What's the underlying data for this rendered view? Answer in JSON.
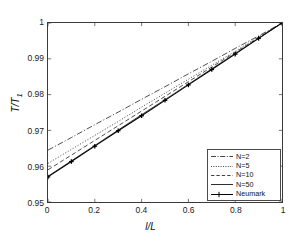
{
  "chart_data": {
    "type": "line",
    "title": "",
    "xlabel": "l/L",
    "ylabel": "T/T1",
    "ylabel_base": "T/T",
    "ylabel_sub": "1",
    "xlim": [
      0,
      1
    ],
    "ylim": [
      0.95,
      1
    ],
    "grid": false,
    "legend_position": "lower right",
    "xticks": [
      0,
      0.2,
      0.4,
      0.6,
      0.8,
      1
    ],
    "xtick_labels": [
      "0",
      "0.2",
      "0.4",
      "0.6",
      "0.8",
      "1"
    ],
    "yticks": [
      0.95,
      0.96,
      0.97,
      0.98,
      0.99,
      1
    ],
    "ytick_labels": [
      "0.95",
      "0.96",
      "0.97",
      "0.98",
      "0.99",
      "1"
    ],
    "x": [
      0,
      0.1,
      0.2,
      0.3,
      0.4,
      0.5,
      0.6,
      0.7,
      0.8,
      0.9,
      1
    ],
    "series": [
      {
        "name": "N=2",
        "style": "dashdot",
        "color": "#2e2e2e",
        "marker": "none",
        "values": [
          0.9645,
          0.968,
          0.9716,
          0.9751,
          0.9787,
          0.9822,
          0.9858,
          0.9893,
          0.9929,
          0.9964,
          1.0
        ]
      },
      {
        "name": "N=5",
        "style": "dotted",
        "color": "#2e2e2e",
        "marker": "none",
        "values": [
          0.9608,
          0.9647,
          0.9686,
          0.9725,
          0.9765,
          0.9804,
          0.9843,
          0.9882,
          0.9921,
          0.9961,
          1.0
        ]
      },
      {
        "name": "N=10",
        "style": "dashed",
        "color": "#2e2e2e",
        "marker": "none",
        "values": [
          0.959,
          0.9631,
          0.9672,
          0.9713,
          0.9754,
          0.9795,
          0.9836,
          0.9877,
          0.9918,
          0.9959,
          1.0
        ]
      },
      {
        "name": "N=50",
        "style": "solid",
        "color": "#2e2e2e",
        "marker": "none",
        "values": [
          0.9572,
          0.9615,
          0.9658,
          0.9701,
          0.9744,
          0.9786,
          0.9829,
          0.9872,
          0.9915,
          0.9957,
          1.0
        ]
      },
      {
        "name": "Neumark",
        "style": "solid",
        "color": "#000000",
        "marker": "plus",
        "values": [
          0.957,
          0.9613,
          0.9656,
          0.9699,
          0.9741,
          0.9784,
          0.9827,
          0.987,
          0.9913,
          0.9957,
          1.0
        ]
      }
    ],
    "legend_entries": [
      {
        "label": "N=2",
        "style": "dashdot",
        "marker": "none"
      },
      {
        "label": "N=5",
        "style": "dotted",
        "marker": "none"
      },
      {
        "label": "N=10",
        "style": "dashed",
        "marker": "none"
      },
      {
        "label": "N=50",
        "style": "solid",
        "marker": "none"
      },
      {
        "label": "Neumark",
        "style": "solid",
        "marker": "plus"
      }
    ]
  }
}
